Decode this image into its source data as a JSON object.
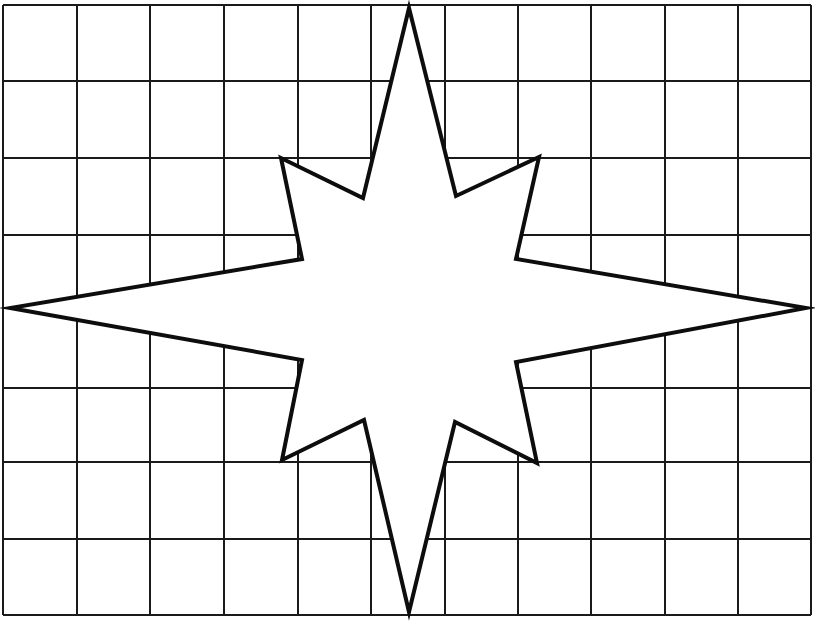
{
  "canvas": {
    "width": 815,
    "height": 621,
    "background": "#ffffff"
  },
  "grid": {
    "stroke": "#1a1a1a",
    "stroke_width": 2,
    "x_lines": [
      3,
      77,
      150,
      224,
      298,
      371,
      445,
      518,
      591,
      665,
      738,
      811
    ],
    "y_lines": [
      5,
      81,
      158,
      235,
      388,
      462,
      539,
      615
    ],
    "left": 3,
    "right": 811,
    "top": 5,
    "bottom": 615
  },
  "star": {
    "fill": "#ffffff",
    "stroke": "#0d0d0d",
    "stroke_width": 4,
    "points": [
      [
        409,
        8
      ],
      [
        456,
        196
      ],
      [
        539,
        157
      ],
      [
        516,
        259
      ],
      [
        806,
        308
      ],
      [
        516,
        362
      ],
      [
        537,
        463
      ],
      [
        455,
        422
      ],
      [
        409,
        612
      ],
      [
        364,
        420
      ],
      [
        282,
        460
      ],
      [
        302,
        360
      ],
      [
        10,
        308
      ],
      [
        302,
        259
      ],
      [
        281,
        158
      ],
      [
        363,
        198
      ]
    ]
  }
}
